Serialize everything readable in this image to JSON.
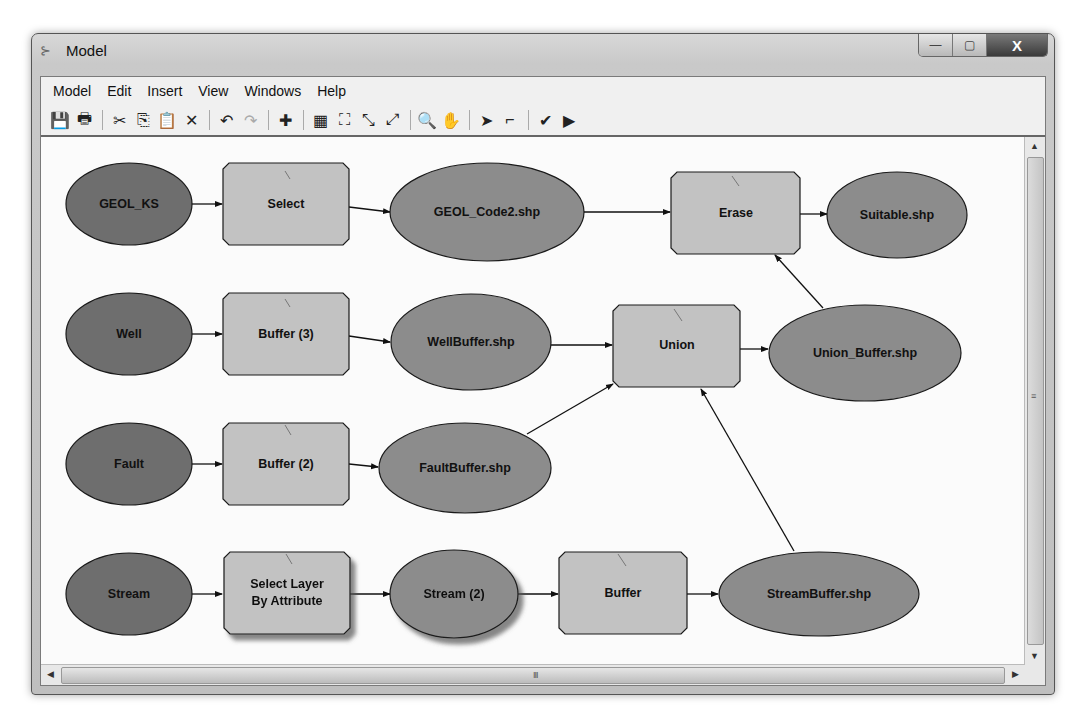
{
  "window": {
    "title": "Model",
    "controls": {
      "minimize": "—",
      "maximize": "▢",
      "close": "X"
    }
  },
  "menu": {
    "items": [
      {
        "label": "Model"
      },
      {
        "label": "Edit"
      },
      {
        "label": "Insert"
      },
      {
        "label": "View"
      },
      {
        "label": "Windows"
      },
      {
        "label": "Help"
      }
    ]
  },
  "toolbar": {
    "buttons": [
      {
        "name": "save-icon",
        "glyph": "💾"
      },
      {
        "name": "print-icon",
        "glyph": "🖶"
      },
      {
        "name": "cut-icon",
        "glyph": "✂"
      },
      {
        "name": "copy-icon",
        "glyph": "⎘"
      },
      {
        "name": "paste-icon",
        "glyph": "📋"
      },
      {
        "name": "delete-icon",
        "glyph": "✕"
      },
      {
        "name": "undo-icon",
        "glyph": "↶"
      },
      {
        "name": "redo-icon",
        "glyph": "↷"
      },
      {
        "name": "add-data-icon",
        "glyph": "✚"
      },
      {
        "name": "auto-layout-icon",
        "glyph": "▦"
      },
      {
        "name": "full-extent-icon",
        "glyph": "⛶"
      },
      {
        "name": "zoom-in-fixed-icon",
        "glyph": "⤡"
      },
      {
        "name": "zoom-out-fixed-icon",
        "glyph": "⤢"
      },
      {
        "name": "zoom-in-icon",
        "glyph": "🔍"
      },
      {
        "name": "pan-icon",
        "glyph": "✋"
      },
      {
        "name": "select-icon",
        "glyph": "➤"
      },
      {
        "name": "add-connection-icon",
        "glyph": "⌐"
      },
      {
        "name": "validate-icon",
        "glyph": "✔"
      },
      {
        "name": "run-icon",
        "glyph": "▶"
      }
    ]
  },
  "colors": {
    "input_data": "#6e6e6e",
    "derived_data": "#8c8c8c",
    "tool": "#c2c2c2",
    "stroke": "#1a1a1a"
  },
  "diagram": {
    "nodes": {
      "geol_ks": {
        "label": "GEOL_KS",
        "type": "input"
      },
      "select": {
        "label": "Select",
        "type": "tool"
      },
      "geol_code2": {
        "label": "GEOL_Code2.shp",
        "type": "derived"
      },
      "erase": {
        "label": "Erase",
        "type": "tool"
      },
      "suitable": {
        "label": "Suitable.shp",
        "type": "derived"
      },
      "well": {
        "label": "Well",
        "type": "input"
      },
      "buffer3": {
        "label": "Buffer (3)",
        "type": "tool"
      },
      "wellbuffer": {
        "label": "WellBuffer.shp",
        "type": "derived"
      },
      "union": {
        "label": "Union",
        "type": "tool"
      },
      "union_buffer": {
        "label": "Union_Buffer.shp",
        "type": "derived"
      },
      "fault": {
        "label": "Fault",
        "type": "input"
      },
      "buffer2": {
        "label": "Buffer (2)",
        "type": "tool"
      },
      "faultbuffer": {
        "label": "FaultBuffer.shp",
        "type": "derived"
      },
      "stream": {
        "label": "Stream",
        "type": "input"
      },
      "select_layer_l1": {
        "label": "Select Layer",
        "type": "tool"
      },
      "select_layer_l2": {
        "label": "By Attribute",
        "type": "tool"
      },
      "stream2": {
        "label": "Stream (2)",
        "type": "derived"
      },
      "buffer": {
        "label": "Buffer",
        "type": "tool"
      },
      "streambuffer": {
        "label": "StreamBuffer.shp",
        "type": "derived"
      }
    }
  },
  "scrollbar": {
    "h_grip": "III",
    "v_grip": "≡"
  }
}
